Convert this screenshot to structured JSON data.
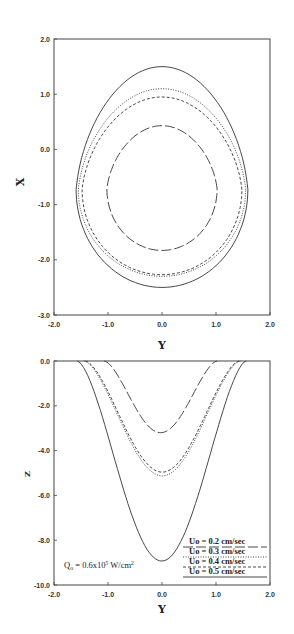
{
  "chart_data": [
    {
      "type": "line",
      "title": "",
      "xlabel": "Y",
      "ylabel": "X",
      "xlim": [
        -2.0,
        2.0
      ],
      "ylim": [
        -3.0,
        2.0
      ],
      "xticks": [
        "-2.0",
        "-1.0",
        "0.0",
        "1.0",
        "2.0"
      ],
      "yticks": [
        "2.0",
        "1.0",
        "0.0",
        "-1.0",
        "-2.0",
        "-3.0"
      ],
      "grid": false,
      "series": [
        {
          "name": "Uo = 0.2 cm/sec",
          "style": "long-dash",
          "top": 0.43,
          "bottom": -1.83,
          "half_width": 1.02,
          "widest_at": -0.72
        },
        {
          "name": "Uo = 0.3 cm/sec",
          "style": "dotted",
          "top": 1.1,
          "bottom": -2.3,
          "half_width": 1.55,
          "widest_at": -0.73
        },
        {
          "name": "Uo = 0.4 cm/sec",
          "style": "dashed",
          "top": 0.95,
          "bottom": -2.27,
          "half_width": 1.48,
          "widest_at": -0.73
        },
        {
          "name": "Uo = 0.5 cm/sec",
          "style": "solid",
          "top": 1.5,
          "bottom": -2.5,
          "half_width": 1.59,
          "widest_at": -0.73
        }
      ]
    },
    {
      "type": "line",
      "title": "",
      "xlabel": "Y",
      "ylabel": "Z",
      "xlim": [
        -2.0,
        2.0
      ],
      "ylim": [
        -10.0,
        0.0
      ],
      "xticks": [
        "-2.0",
        "-1.0",
        "0.0",
        "1.0",
        "2.0"
      ],
      "yticks": [
        "0.0",
        "-2.0",
        "-4.0",
        "-6.0",
        "-8.0",
        "-10.0"
      ],
      "grid": false,
      "legend_position": "lower right",
      "annotation": "Qo = 0.6x10^5 W/cm^2",
      "series": [
        {
          "name": "Uo = 0.2 cm/sec",
          "style": "long-dash",
          "min_z": -3.2,
          "y_at_z0": [
            -1.07,
            1.02
          ]
        },
        {
          "name": "Uo = 0.3 cm/sec",
          "style": "dotted",
          "min_z": -5.13,
          "y_at_z0": [
            -1.44,
            1.45
          ]
        },
        {
          "name": "Uo = 0.4 cm/sec",
          "style": "dashed",
          "min_z": -4.96,
          "y_at_z0": [
            -1.42,
            1.43
          ]
        },
        {
          "name": "Uo = 0.5 cm/sec",
          "style": "solid",
          "min_z": -8.93,
          "y_at_z0": [
            -1.57,
            1.56
          ]
        }
      ]
    }
  ],
  "top_plot": {
    "ylabel": "X",
    "xlabel": "Y",
    "yticks": [
      "2.0",
      "1.0",
      "0.0",
      "-1.0",
      "-2.0",
      "-3.0"
    ],
    "xticks": [
      "-2.0",
      "-1.0",
      "0.0",
      "1.0",
      "2.0"
    ]
  },
  "bottom_plot": {
    "ylabel": "Z",
    "xlabel": "Y",
    "yticks": [
      "0.0",
      "-2.0",
      "-4.0",
      "-6.0",
      "-8.0",
      "-10.0"
    ],
    "xticks": [
      "-2.0",
      "-1.0",
      "0.0",
      "1.0",
      "2.0"
    ],
    "annotation": {
      "q": "Q",
      "sub": "o",
      "text": " = 0.6x10",
      "sup": "5",
      "unit": " W/cm",
      "unit_sup": "2"
    },
    "legend": [
      "Uo = 0.2 cm/sec",
      "Uo = 0.3 cm/sec",
      "Uo = 0.4 cm/sec",
      "Uo = 0.5 cm/sec"
    ]
  }
}
